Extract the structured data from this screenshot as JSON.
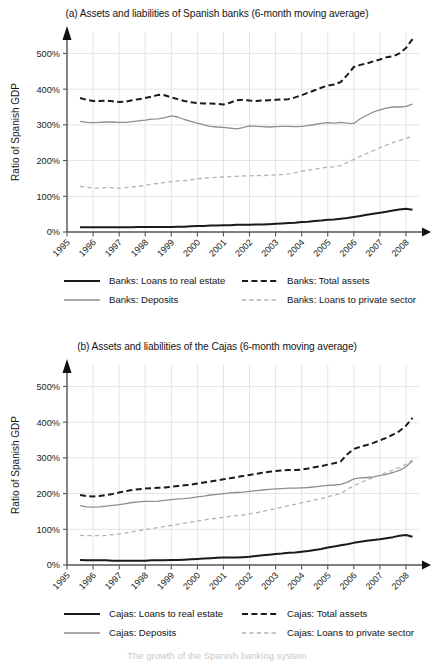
{
  "figure": {
    "width": 434,
    "height": 663,
    "background": "#ffffff",
    "footnote_partial": "The growth of the Spanish banking system"
  },
  "colors": {
    "dark": "#1a1a1a",
    "grey": "#8d8d8d",
    "light_grey": "#b2b2b2",
    "grid": "#d8d8d8",
    "axis": "#555555",
    "text": "#1b1b1b"
  },
  "chart_data": [
    {
      "id": "panel-a",
      "type": "line",
      "title": "(a) Assets and liabilities of Spanish banks (6-month moving average)",
      "xlabel": "",
      "ylabel": "Ratio of Spanish GDP",
      "ylim": [
        0,
        560
      ],
      "yticks": [
        0,
        100,
        200,
        300,
        400,
        500
      ],
      "ytick_labels": [
        "0%",
        "100%",
        "200%",
        "300%",
        "400%",
        "500%"
      ],
      "xlim": [
        1995,
        2008.5
      ],
      "xticks": [
        1995,
        1996,
        1997,
        1998,
        1999,
        2000,
        2001,
        2002,
        2003,
        2004,
        2005,
        2006,
        2007,
        2008
      ],
      "xtick_labels": [
        "1995",
        "1996",
        "1997",
        "1998",
        "1999",
        "2000",
        "2001",
        "2002",
        "2003",
        "2004",
        "2005",
        "2006",
        "2007",
        "2008"
      ],
      "grid": true,
      "legend_position": "below",
      "x": [
        1995.5,
        1995.75,
        1996.0,
        1996.25,
        1996.5,
        1996.75,
        1997.0,
        1997.25,
        1997.5,
        1997.75,
        1998.0,
        1998.25,
        1998.5,
        1998.75,
        1999.0,
        1999.25,
        1999.5,
        1999.75,
        2000.0,
        2000.25,
        2000.5,
        2000.75,
        2001.0,
        2001.25,
        2001.5,
        2001.75,
        2002.0,
        2002.25,
        2002.5,
        2002.75,
        2003.0,
        2003.25,
        2003.5,
        2003.75,
        2004.0,
        2004.25,
        2004.5,
        2004.75,
        2005.0,
        2005.25,
        2005.5,
        2005.75,
        2006.0,
        2006.25,
        2006.5,
        2006.75,
        2007.0,
        2007.25,
        2007.5,
        2007.75,
        2008.0,
        2008.25
      ],
      "series": [
        {
          "name": "Banks: Total assets",
          "style": "dashed-dark",
          "color": "#1a1a1a",
          "values": [
            375,
            370,
            367,
            367,
            368,
            366,
            364,
            365,
            369,
            372,
            375,
            379,
            384,
            383,
            377,
            372,
            367,
            363,
            361,
            360,
            360,
            359,
            357,
            362,
            369,
            370,
            368,
            367,
            368,
            369,
            370,
            371,
            372,
            377,
            383,
            390,
            397,
            404,
            410,
            413,
            420,
            440,
            462,
            468,
            472,
            478,
            483,
            489,
            492,
            500,
            515,
            540
          ]
        },
        {
          "name": "Banks: Deposits",
          "style": "solid-grey",
          "color": "#8d8d8d",
          "values": [
            310,
            307,
            306,
            307,
            308,
            308,
            307,
            307,
            309,
            311,
            313,
            316,
            317,
            320,
            325,
            322,
            315,
            310,
            305,
            300,
            296,
            294,
            293,
            291,
            289,
            292,
            297,
            296,
            295,
            294,
            295,
            296,
            296,
            295,
            296,
            298,
            301,
            304,
            306,
            305,
            307,
            305,
            304,
            317,
            327,
            336,
            342,
            347,
            350,
            350,
            352,
            358,
            370,
            383
          ]
        },
        {
          "name": "Banks: Loans to private sector",
          "style": "dashed-light",
          "color": "#b2b2b2",
          "values": [
            128,
            125,
            123,
            123,
            124,
            124,
            123,
            124,
            126,
            128,
            131,
            134,
            136,
            139,
            141,
            143,
            144,
            146,
            149,
            151,
            152,
            153,
            154,
            155,
            156,
            157,
            157,
            158,
            158,
            159,
            160,
            161,
            163,
            166,
            170,
            173,
            176,
            179,
            181,
            183,
            186,
            195,
            203,
            212,
            220,
            228,
            236,
            243,
            250,
            256,
            262,
            268
          ]
        },
        {
          "name": "Banks: Loans to real estate",
          "style": "solid-dark",
          "color": "#1a1a1a",
          "values": [
            13,
            13,
            13,
            13,
            13,
            13,
            13,
            13,
            13,
            14,
            14,
            14,
            14,
            14,
            14,
            15,
            15,
            16,
            17,
            17,
            18,
            18,
            19,
            19,
            20,
            20,
            20,
            21,
            21,
            22,
            23,
            24,
            25,
            26,
            28,
            29,
            31,
            32,
            34,
            35,
            37,
            39,
            42,
            45,
            48,
            51,
            54,
            57,
            60,
            63,
            65,
            62
          ]
        }
      ],
      "legend": [
        {
          "label": "Banks: Loans to real estate",
          "style": "solid-dark",
          "color": "#1a1a1a"
        },
        {
          "label": "Banks: Total assets",
          "style": "dashed-dark",
          "color": "#1a1a1a"
        },
        {
          "label": "Banks: Deposits",
          "style": "solid-grey",
          "color": "#8d8d8d"
        },
        {
          "label": "Banks: Loans to private sector",
          "style": "dashed-light",
          "color": "#b2b2b2"
        }
      ]
    },
    {
      "id": "panel-b",
      "type": "line",
      "title": "(b) Assets and liabilities of the Cajas (6-month moving average)",
      "xlabel": "",
      "ylabel": "Ratio of Spanish GDP",
      "ylim": [
        0,
        560
      ],
      "yticks": [
        0,
        100,
        200,
        300,
        400,
        500
      ],
      "ytick_labels": [
        "0%",
        "100%",
        "200%",
        "300%",
        "400%",
        "500%"
      ],
      "xlim": [
        1995,
        2008.5
      ],
      "xticks": [
        1995,
        1996,
        1997,
        1998,
        1999,
        2000,
        2001,
        2002,
        2003,
        2004,
        2005,
        2006,
        2007,
        2008
      ],
      "xtick_labels": [
        "1995",
        "1996",
        "1997",
        "1998",
        "1999",
        "2000",
        "2001",
        "2002",
        "2003",
        "2004",
        "2005",
        "2006",
        "2007",
        "2008"
      ],
      "grid": true,
      "legend_position": "below",
      "x": [
        1995.5,
        1995.75,
        1996.0,
        1996.25,
        1996.5,
        1996.75,
        1997.0,
        1997.25,
        1997.5,
        1997.75,
        1998.0,
        1998.25,
        1998.5,
        1998.75,
        1999.0,
        1999.25,
        1999.5,
        1999.75,
        2000.0,
        2000.25,
        2000.5,
        2000.75,
        2001.0,
        2001.25,
        2001.5,
        2001.75,
        2002.0,
        2002.25,
        2002.5,
        2002.75,
        2003.0,
        2003.25,
        2003.5,
        2003.75,
        2004.0,
        2004.25,
        2004.5,
        2004.75,
        2005.0,
        2005.25,
        2005.5,
        2005.75,
        2006.0,
        2006.25,
        2006.5,
        2006.75,
        2007.0,
        2007.25,
        2007.5,
        2007.75,
        2008.0,
        2008.25
      ],
      "series": [
        {
          "name": "Cajas: Total assets",
          "style": "dashed-dark",
          "color": "#1a1a1a",
          "values": [
            196,
            193,
            192,
            193,
            196,
            199,
            203,
            207,
            210,
            212,
            214,
            215,
            216,
            217,
            219,
            221,
            223,
            225,
            228,
            231,
            234,
            237,
            240,
            243,
            246,
            249,
            252,
            255,
            258,
            261,
            263,
            265,
            266,
            266,
            267,
            270,
            274,
            277,
            281,
            285,
            290,
            310,
            325,
            331,
            336,
            342,
            349,
            356,
            365,
            375,
            390,
            412
          ]
        },
        {
          "name": "Cajas: Deposits",
          "style": "solid-grey",
          "color": "#8d8d8d",
          "values": [
            166,
            163,
            162,
            163,
            165,
            167,
            169,
            172,
            175,
            177,
            178,
            178,
            179,
            181,
            183,
            185,
            186,
            188,
            191,
            193,
            196,
            198,
            200,
            202,
            203,
            204,
            206,
            208,
            210,
            212,
            213,
            214,
            215,
            215,
            216,
            217,
            219,
            221,
            223,
            224,
            226,
            232,
            241,
            244,
            245,
            247,
            250,
            254,
            259,
            265,
            275,
            292
          ]
        },
        {
          "name": "Cajas: Loans to private sector",
          "style": "dashed-light",
          "color": "#b2b2b2",
          "values": [
            83,
            82,
            82,
            82,
            83,
            85,
            87,
            90,
            93,
            96,
            99,
            102,
            105,
            108,
            111,
            114,
            117,
            120,
            123,
            126,
            129,
            131,
            134,
            136,
            138,
            140,
            143,
            146,
            150,
            154,
            158,
            162,
            166,
            170,
            174,
            178,
            182,
            186,
            191,
            196,
            200,
            212,
            222,
            230,
            238,
            245,
            252,
            259,
            266,
            273,
            282,
            294
          ]
        },
        {
          "name": "Cajas: Loans to real estate",
          "style": "solid-dark",
          "color": "#1a1a1a",
          "values": [
            14,
            13,
            13,
            13,
            13,
            12,
            12,
            12,
            12,
            12,
            12,
            13,
            13,
            13,
            14,
            14,
            15,
            16,
            17,
            18,
            19,
            20,
            21,
            21,
            21,
            22,
            23,
            25,
            27,
            29,
            31,
            32,
            34,
            35,
            37,
            39,
            42,
            45,
            49,
            52,
            55,
            58,
            62,
            65,
            68,
            70,
            72,
            75,
            78,
            82,
            84,
            79
          ]
        }
      ],
      "legend": [
        {
          "label": "Cajas: Loans to real estate",
          "style": "solid-dark",
          "color": "#1a1a1a"
        },
        {
          "label": "Cajas: Total assets",
          "style": "dashed-dark",
          "color": "#1a1a1a"
        },
        {
          "label": "Cajas: Deposits",
          "style": "solid-grey",
          "color": "#8d8d8d"
        },
        {
          "label": "Cajas: Loans to private sector",
          "style": "dashed-light",
          "color": "#b2b2b2"
        }
      ]
    }
  ]
}
